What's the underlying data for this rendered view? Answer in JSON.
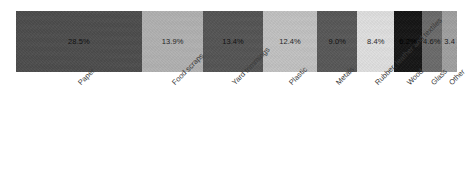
{
  "chart_data": {
    "type": "bar",
    "orientation": "horizontal-stacked",
    "title": "",
    "subtitle": "",
    "xlabel": "",
    "ylabel": "",
    "grid": false,
    "legend": "none",
    "categories": [
      "Paper",
      "Food scraps",
      "Yard trimmings",
      "Plastic",
      "Metals",
      "Rubber, leather and textiles",
      "Wood",
      "Glass",
      "Other"
    ],
    "values": [
      28.5,
      13.9,
      13.4,
      12.4,
      9.0,
      8.4,
      6.2,
      4.6,
      3.4
    ],
    "value_labels": [
      "28.5%",
      "13.9%",
      "13.4%",
      "12.4%",
      "9.0%",
      "8.4%",
      "6.2%",
      "4.6%",
      "3.4"
    ],
    "colors": [
      "#4d4d4d",
      "#b1b1b1",
      "#555555",
      "#c2c2c2",
      "#585858",
      "#e0e0e0",
      "#151515",
      "#6b6b6b",
      "#a0a0a0"
    ],
    "value_label_colors": [
      "#111111",
      "#262626",
      "#111111",
      "#262626",
      "#111111",
      "#2b2b2b",
      "#000000",
      "#1a1a1a",
      "#1a1a1a"
    ],
    "total": 100,
    "xlim": [
      0,
      100
    ]
  },
  "segments": [
    {
      "label": "Paper",
      "value_label": "28.5%",
      "value": 28.5
    },
    {
      "label": "Food scraps",
      "value_label": "13.9%",
      "value": 13.9
    },
    {
      "label": "Yard trimmings",
      "value_label": "13.4%",
      "value": 13.4
    },
    {
      "label": "Plastic",
      "value_label": "12.4%",
      "value": 12.4
    },
    {
      "label": "Metals",
      "value_label": "9.0%",
      "value": 9.0
    },
    {
      "label": "Rubber, leather and textiles",
      "value_label": "8.4%",
      "value": 8.4
    },
    {
      "label": "Wood",
      "value_label": "6.2%",
      "value": 6.2
    },
    {
      "label": "Glass",
      "value_label": "4.6%",
      "value": 4.6
    },
    {
      "label": "Other",
      "value_label": "3.4",
      "value": 3.4
    }
  ]
}
